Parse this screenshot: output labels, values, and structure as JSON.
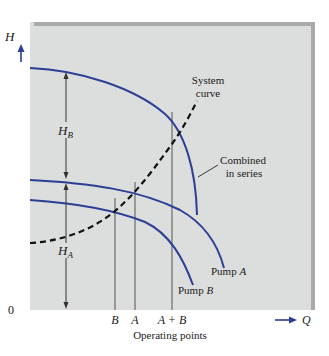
{
  "figure": {
    "y_axis": {
      "label": "H",
      "zero_label": "0"
    },
    "x_axis": {
      "label": "Q",
      "caption": "Operating points"
    },
    "operating_points": [
      {
        "id": "B",
        "label": "B"
      },
      {
        "id": "A",
        "label": "A"
      },
      {
        "id": "AB",
        "label": "A + B"
      }
    ],
    "head_labels": {
      "hb": {
        "main": "H",
        "sub": "B"
      },
      "ha": {
        "main": "H",
        "sub": "A"
      }
    },
    "curves": {
      "system": {
        "line1": "System",
        "line2": "curve",
        "style": "dashed"
      },
      "combined": {
        "line1": "Combined",
        "line2": "in series"
      },
      "pump_a": {
        "prefix": "Pump ",
        "name": "A"
      },
      "pump_b": {
        "prefix": "Pump ",
        "name": "B"
      }
    },
    "colors": {
      "panel_bg": "#dcdddd",
      "panel_border": "#a9aaab",
      "curve_blue": "#2b3f95",
      "system_dash": "#111111",
      "guide_line": "#555555"
    }
  }
}
